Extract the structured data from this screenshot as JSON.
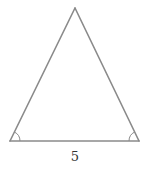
{
  "diagram": {
    "type": "geometry",
    "shape": "isosceles-triangle",
    "stroke_color": "#8a8a8a",
    "background": "#ffffff",
    "vertices": {
      "apex": [
        75,
        8
      ],
      "base_left": [
        10,
        141
      ],
      "base_right": [
        139,
        141
      ]
    },
    "base_label": "5",
    "angle_markers": [
      {
        "vertex": "base_left",
        "type": "single-arc"
      },
      {
        "vertex": "base_right",
        "type": "single-arc"
      }
    ]
  }
}
